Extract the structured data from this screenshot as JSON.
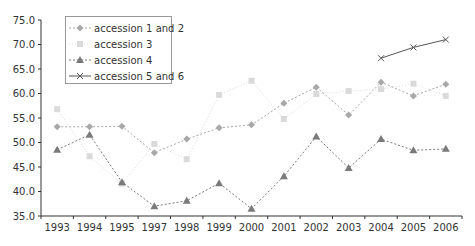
{
  "chart_data": {
    "type": "line",
    "title": "",
    "xlabel": "",
    "ylabel": "",
    "categories": [
      "1993",
      "1994",
      "1995",
      "1997",
      "1998",
      "1999",
      "2000",
      "2001",
      "2002",
      "2003",
      "2004",
      "2005",
      "2006"
    ],
    "ylim": [
      35.0,
      75.0
    ],
    "yticks": [
      "35.0",
      "40.0",
      "45.0",
      "50.0",
      "55.0",
      "60.0",
      "65.0",
      "70.0",
      "75.0"
    ],
    "grid": false,
    "legend_position": "upper-left-inside",
    "series": [
      {
        "name": "accession 1 and 2",
        "marker": "diamond",
        "color": "#a8a8a8",
        "dash": "2,2",
        "values": [
          53.2,
          53.2,
          53.3,
          47.9,
          50.7,
          53.0,
          53.6,
          58.0,
          61.3,
          55.6,
          62.3,
          59.5,
          61.9
        ]
      },
      {
        "name": "accession 3",
        "marker": "square",
        "color": "#dadada",
        "dash": "1,2",
        "values": [
          56.8,
          47.2,
          41.6,
          49.7,
          46.6,
          59.7,
          62.6,
          54.8,
          59.9,
          60.5,
          60.9,
          62.0,
          59.5
        ]
      },
      {
        "name": "accession 4",
        "marker": "triangle",
        "color": "#7a7a7a",
        "dash": "2,2",
        "values": [
          48.5,
          51.6,
          41.9,
          37.0,
          38.1,
          41.7,
          36.5,
          43.1,
          51.2,
          44.8,
          50.7,
          48.4,
          48.7
        ]
      },
      {
        "name": "accession 5 and 6",
        "marker": "x",
        "color": "#555555",
        "dash": "",
        "values": [
          null,
          null,
          null,
          null,
          null,
          null,
          null,
          null,
          null,
          null,
          67.2,
          69.4,
          71.0
        ]
      }
    ]
  }
}
